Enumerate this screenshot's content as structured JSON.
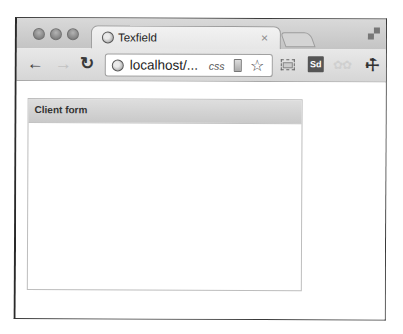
{
  "window": {
    "controls": [
      "close",
      "minimize",
      "zoom"
    ]
  },
  "tab": {
    "title": "Texfield",
    "close_glyph": "×",
    "icon": "globe-icon"
  },
  "toolbar": {
    "back_glyph": "←",
    "forward_glyph": "→",
    "reload_glyph": "↻",
    "address": {
      "url": "localhost/...",
      "tag": "css",
      "icon": "globe-icon"
    },
    "star_glyph": "☆",
    "extensions": [
      {
        "name": "screen-capture",
        "label": ""
      },
      {
        "name": "sd",
        "label": "Sd"
      },
      {
        "name": "faded-extension",
        "label": "✿✿"
      }
    ],
    "wrench_glyph": "🔧"
  },
  "content": {
    "panel": {
      "title": "Client form"
    }
  },
  "colors": {
    "chrome_frame": "#c8c8c8",
    "panel_header": "#d2d2d2",
    "panel_border": "#bdbdbd",
    "sd_badge": "#555555"
  }
}
